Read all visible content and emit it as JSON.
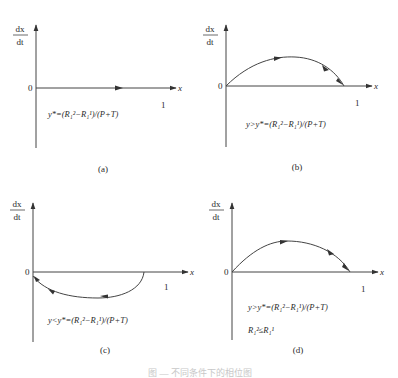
{
  "panels": [
    {
      "id": "a",
      "y_axis_label_num": "dx",
      "y_axis_label_den": "dt",
      "origin_label": "0",
      "x_axis_label": "x",
      "x_tick_label": "1",
      "formula": "y*=(R₁²−R₁¹)/(P+T)",
      "panel_label": "(a)",
      "curve": "none (dx/dt = 0 along x-axis, arrow pointing right)"
    },
    {
      "id": "b",
      "y_axis_label_num": "dx",
      "y_axis_label_den": "dt",
      "origin_label": "0",
      "x_axis_label": "x",
      "x_tick_label": "1",
      "formula": "y>y*=(R₁²−R₁¹)/(P+T)",
      "panel_label": "(b)",
      "curve": "positive arch from 0 to 1, arrows pointing right"
    },
    {
      "id": "c",
      "y_axis_label_num": "dx",
      "y_axis_label_den": "dt",
      "origin_label": "0",
      "x_axis_label": "x",
      "x_tick_label": "1",
      "formula": "y<y*=(R₁²−R₁¹)/(P+T)",
      "panel_label": "(c)",
      "curve": "negative arch below axis, arrows pointing left toward 0"
    },
    {
      "id": "d",
      "y_axis_label_num": "dx",
      "y_axis_label_den": "dt",
      "origin_label": "0",
      "x_axis_label": "x",
      "x_tick_label": "1",
      "formula": "y>y*=(R₁²−R₁¹)/(P+T)",
      "formula2": "R₁²≤R₁¹",
      "panel_label": "(d)",
      "curve": "positive arch from 0 to near 1, arrows pointing right"
    }
  ],
  "caption": "图 — 不同条件下的相位图"
}
